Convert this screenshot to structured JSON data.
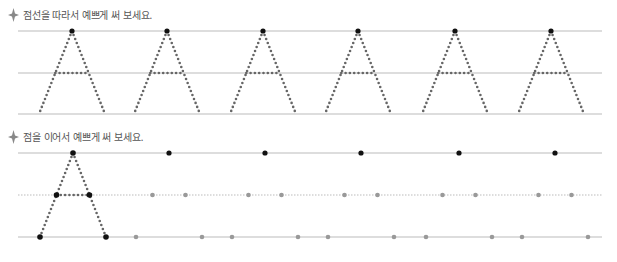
{
  "worksheet": {
    "section1": {
      "instruction": "점선을 따라서 예쁘게 써 보세요.",
      "bullet_icon": "diamond-bullet-icon",
      "letter": "A",
      "repeat_count": 6,
      "lines": {
        "top_y": 31,
        "mid_y": 73,
        "bottom_y": 114,
        "x_start": 18,
        "x_end": 602
      },
      "letter_apex_x": [
        72,
        167,
        263,
        358,
        455,
        551
      ]
    },
    "section2": {
      "instruction": "점을 이어서 예쁘게 써 보세요.",
      "bullet_icon": "diamond-bullet-icon",
      "letter": "A",
      "lines": {
        "top_y": 153,
        "mid_y": 195,
        "bottom_y": 237,
        "x_start": 18,
        "x_end": 602
      },
      "example_apex_x": 73,
      "guide_apex_x": [
        169,
        265,
        361,
        459,
        555
      ]
    },
    "colors": {
      "line": "#bbbbbb",
      "dotted_letter": "#666666",
      "apex_dot": "#111111",
      "guide_dot": "#999999",
      "text": "#555555",
      "bullet": "#888888"
    }
  }
}
